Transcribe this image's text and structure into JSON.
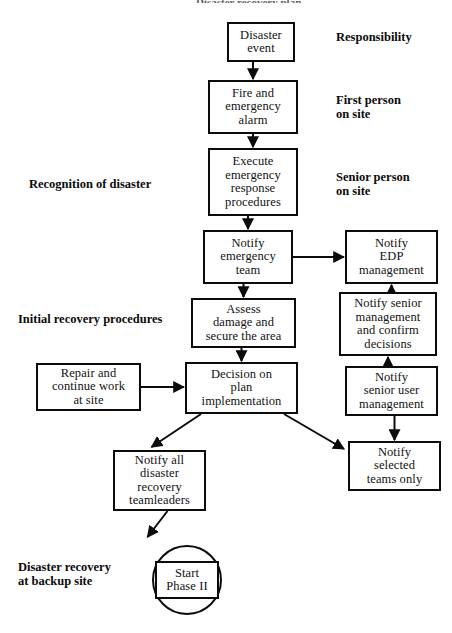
{
  "diagram": {
    "title_fragment": "Disaster recovery plan",
    "nodes": [
      {
        "id": "disaster-event",
        "label": "Disaster\nevent",
        "x": 227,
        "y": 22,
        "w": 68,
        "h": 40
      },
      {
        "id": "fire-alarm",
        "label": "Fire and\nemergency\nalarm",
        "x": 208,
        "y": 80,
        "w": 90,
        "h": 54
      },
      {
        "id": "execute-procedures",
        "label": "Execute\nemergency\nresponse\nprocedures",
        "x": 208,
        "y": 148,
        "w": 90,
        "h": 68
      },
      {
        "id": "notify-emergency-team",
        "label": "Notify\nemergency\nteam",
        "x": 203,
        "y": 230,
        "w": 90,
        "h": 54
      },
      {
        "id": "assess-damage",
        "label": "Assess\ndamage and\nsecure the area",
        "x": 191,
        "y": 298,
        "w": 105,
        "h": 50
      },
      {
        "id": "decision-plan",
        "label": "Decision on\nplan\nimplementation",
        "x": 185,
        "y": 362,
        "w": 113,
        "h": 52
      },
      {
        "id": "repair-continue",
        "label": "Repair and\ncontinue work\nat site",
        "x": 36,
        "y": 363,
        "w": 105,
        "h": 48
      },
      {
        "id": "notify-edp",
        "label": "Notify\nEDP\nmanagement",
        "x": 345,
        "y": 230,
        "w": 93,
        "h": 54
      },
      {
        "id": "notify-senior-mgmt",
        "label": "Notify senior\nmanagement\nand confirm\ndecisions",
        "x": 339,
        "y": 292,
        "w": 98,
        "h": 64
      },
      {
        "id": "notify-senior-user",
        "label": "Notify\nsenior user\nmanagement",
        "x": 345,
        "y": 366,
        "w": 93,
        "h": 50
      },
      {
        "id": "notify-selected-teams",
        "label": "Notify\nselected\nteams only",
        "x": 348,
        "y": 441,
        "w": 93,
        "h": 50
      },
      {
        "id": "notify-teamleaders",
        "label": "Notify all\ndisaster\nrecovery\nteamleaders",
        "x": 113,
        "y": 450,
        "w": 93,
        "h": 61
      },
      {
        "id": "start-phase-ii",
        "label": "Start\nPhase II",
        "x": 155,
        "y": 561,
        "w": 64,
        "h": 38
      }
    ],
    "circle": {
      "id": "start-phase-ii-circle",
      "cx": 187,
      "cy": 580,
      "r": 35
    },
    "swim_labels": [
      {
        "id": "responsibility",
        "text": "Responsibility",
        "x": 336,
        "y": 30
      },
      {
        "id": "first-person-on-site",
        "text": "First person\non site",
        "x": 336,
        "y": 93
      },
      {
        "id": "senior-person-on-site",
        "text": "Senior person\non site",
        "x": 336,
        "y": 170
      },
      {
        "id": "recognition-disaster",
        "text": "Recognition of disaster",
        "x": 29,
        "y": 177
      },
      {
        "id": "initial-recovery",
        "text": "Initial recovery procedures",
        "x": 18,
        "y": 312
      },
      {
        "id": "disaster-recovery-bkp",
        "text": "Disaster recovery\nat backup site",
        "x": 18,
        "y": 560
      }
    ],
    "edges": [
      {
        "id": "e-event-to-alarm",
        "from": "disaster-event",
        "to": "fire-alarm",
        "kind": "vertical-down"
      },
      {
        "id": "e-alarm-to-execute",
        "from": "fire-alarm",
        "to": "execute-procedures",
        "kind": "vertical-down"
      },
      {
        "id": "e-execute-to-notifyteam",
        "from": "execute-procedures",
        "to": "notify-emergency-team",
        "kind": "vertical-down"
      },
      {
        "id": "e-notifyteam-to-assess",
        "from": "notify-emergency-team",
        "to": "assess-damage",
        "kind": "vertical-down"
      },
      {
        "id": "e-assess-to-decision",
        "from": "assess-damage",
        "to": "decision-plan",
        "kind": "vertical-down"
      },
      {
        "id": "e-notifyteam-to-edp",
        "from": "notify-emergency-team",
        "to": "notify-edp",
        "kind": "horizontal-right"
      },
      {
        "id": "e-seniormgmt-to-edp",
        "from": "notify-senior-mgmt",
        "to": "notify-edp",
        "kind": "vertical-up"
      },
      {
        "id": "e-senioruser-to-mgmt",
        "from": "notify-senior-user",
        "to": "notify-senior-mgmt",
        "kind": "vertical-up"
      },
      {
        "id": "e-senioruser-to-selected",
        "from": "notify-senior-user",
        "to": "notify-selected-teams",
        "kind": "vertical-down"
      },
      {
        "id": "e-repair-to-decision",
        "from": "repair-continue",
        "to": "decision-plan",
        "kind": "horizontal-right"
      },
      {
        "id": "e-decision-to-teamleads",
        "from": "decision-plan",
        "to": "notify-teamleaders",
        "kind": "diagonal-down-left"
      },
      {
        "id": "e-decision-to-selected",
        "from": "decision-plan",
        "to": "notify-selected-teams",
        "kind": "diagonal-down-right"
      },
      {
        "id": "e-teamleads-to-start",
        "from": "notify-teamleaders",
        "to": "start-phase-ii",
        "kind": "diagonal-down-left-short"
      }
    ],
    "colors": {
      "ink": "#0b0b0b",
      "paper": "#ffffff"
    }
  }
}
